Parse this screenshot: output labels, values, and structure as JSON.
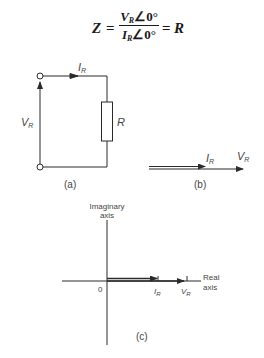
{
  "formula": {
    "lhs": "Z",
    "equals": "=",
    "numerator_symbol": "V",
    "numerator_sub": "R",
    "numerator_angle": "∠0°",
    "denominator_symbol": "I",
    "denominator_sub": "R",
    "denominator_angle": "∠0°",
    "rhs": "R"
  },
  "circuit_a": {
    "current_label": "I",
    "current_sub": "R",
    "voltage_label": "V",
    "voltage_sub": "R",
    "resistor_label": "R",
    "caption": "(a)"
  },
  "phasor_b": {
    "current_label": "I",
    "current_sub": "R",
    "voltage_label": "V",
    "voltage_sub": "R",
    "caption": "(b)"
  },
  "argand_c": {
    "imag_axis_label_1": "Imaginary",
    "imag_axis_label_2": "axis",
    "real_axis_label_1": "Real",
    "real_axis_label_2": "axis",
    "origin_label": "0",
    "current_label": "I",
    "current_sub": "R",
    "voltage_label": "V",
    "voltage_sub": "R",
    "caption": "(c)"
  },
  "colors": {
    "line": "#2a2a2a",
    "label": "#444444"
  }
}
